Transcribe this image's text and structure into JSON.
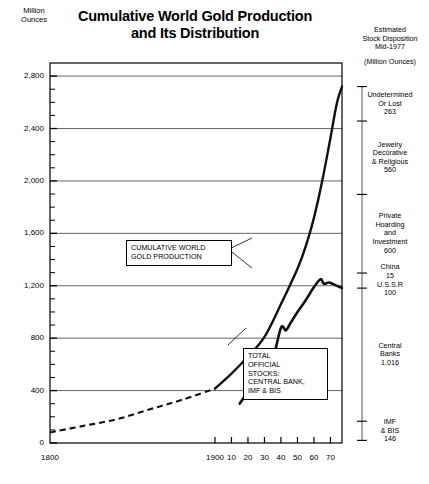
{
  "title": {
    "line1": "Cumulative World Gold Production",
    "line2": "and Its Distribution"
  },
  "yaxis": {
    "unit_line1": "Million",
    "unit_line2": "Ounces",
    "ticks": [
      "2,800",
      "2,400",
      "2,000",
      "1,600",
      "1,200",
      "800",
      "400",
      "0"
    ],
    "tick_values": [
      2800,
      2400,
      2000,
      1600,
      1200,
      800,
      400,
      0
    ]
  },
  "xaxis": {
    "ticks": [
      "1800",
      "1900",
      "10",
      "20",
      "30",
      "40",
      "50",
      "60",
      "70"
    ],
    "tick_values": [
      1800,
      1900,
      1910,
      1920,
      1930,
      1940,
      1950,
      1960,
      1970
    ]
  },
  "right_panel": {
    "heading_line1": "Estimated",
    "heading_line2": "Stock Disposition",
    "heading_line3": "Mid-1977",
    "unit": "(Million Ounces)",
    "segments": [
      {
        "name": "Undetermined Or Lost",
        "lines": [
          "Undetermined",
          "Or Lost",
          "263"
        ],
        "value": 263
      },
      {
        "name": "Jewelry Decorative & Religious",
        "lines": [
          "Jewelry",
          "Decorative",
          "& Religious",
          "560"
        ],
        "value": 560
      },
      {
        "name": "Private Hoarding and Investment",
        "lines": [
          "Private",
          "Hoarding",
          "and",
          "Investment",
          "600"
        ],
        "value": 600
      },
      {
        "name": "China and USSR",
        "lines": [
          "China",
          "15",
          "U.S.S.R",
          "100"
        ],
        "value": 115
      },
      {
        "name": "Central Banks",
        "lines": [
          "Central",
          "Banks",
          "1,016"
        ],
        "value": 1016
      },
      {
        "name": "IMF & BIS",
        "lines": [
          "IMF",
          "& BIS",
          "146"
        ],
        "value": 146
      }
    ]
  },
  "callouts": {
    "production": {
      "lines": [
        "CUMULATIVE WORLD",
        "GOLD PRODUCTION"
      ]
    },
    "stocks": {
      "lines": [
        "TOTAL",
        "OFFICIAL",
        "STOCKS:",
        "CENTRAL BANK,",
        "IMF & BIS"
      ]
    }
  },
  "chart_data": {
    "type": "line",
    "title": "Cumulative World Gold Production and Its Distribution",
    "xlabel": "",
    "ylabel": "Million Ounces",
    "xlim": [
      1800,
      1977
    ],
    "ylim": [
      0,
      2900
    ],
    "grid": true,
    "legend": "annotated-callouts",
    "series": [
      {
        "name": "Cumulative World Gold Production",
        "style": "solid-with-dashed-early-segment",
        "dashed_until_year": 1900,
        "points": [
          [
            1800,
            80
          ],
          [
            1820,
            130
          ],
          [
            1840,
            180
          ],
          [
            1860,
            255
          ],
          [
            1880,
            330
          ],
          [
            1900,
            415
          ],
          [
            1910,
            530
          ],
          [
            1920,
            660
          ],
          [
            1930,
            810
          ],
          [
            1940,
            1060
          ],
          [
            1950,
            1330
          ],
          [
            1955,
            1500
          ],
          [
            1960,
            1720
          ],
          [
            1965,
            2000
          ],
          [
            1970,
            2330
          ],
          [
            1974,
            2600
          ],
          [
            1977,
            2720
          ]
        ]
      },
      {
        "name": "Total Official Stocks: Central Bank, IMF & BIS",
        "style": "solid-thick",
        "points": [
          [
            1915,
            300
          ],
          [
            1920,
            390
          ],
          [
            1925,
            470
          ],
          [
            1930,
            560
          ],
          [
            1935,
            640
          ],
          [
            1940,
            880
          ],
          [
            1943,
            860
          ],
          [
            1946,
            920
          ],
          [
            1950,
            1000
          ],
          [
            1955,
            1090
          ],
          [
            1960,
            1190
          ],
          [
            1964,
            1250
          ],
          [
            1966,
            1215
          ],
          [
            1969,
            1225
          ],
          [
            1972,
            1210
          ],
          [
            1977,
            1182
          ]
        ]
      }
    ],
    "annotations": [
      {
        "text": "CUMULATIVE WORLD GOLD PRODUCTION",
        "points_to_year": 1948
      },
      {
        "text": "TOTAL OFFICIAL STOCKS: CENTRAL BANK, IMF & BIS",
        "points_to_year": 1941
      }
    ]
  }
}
